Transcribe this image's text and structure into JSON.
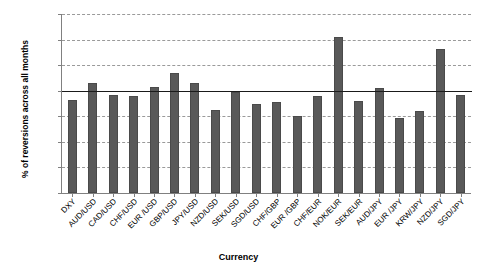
{
  "chart_data": {
    "type": "bar",
    "title": "",
    "xlabel": "Currency",
    "ylabel": "% of reversions across all months",
    "ylim": [
      0,
      7
    ],
    "ytick_labels": [
      "0.0%",
      "1.0%",
      "2.0%",
      "3.0%",
      "4.0%",
      "5.0%",
      "6.0%",
      "7.0%"
    ],
    "ytick_values": [
      0,
      1,
      2,
      3,
      4,
      5,
      6,
      7
    ],
    "grid": true,
    "legend": "none",
    "bar_color": "#595959",
    "reference_line": {
      "value": 4.0,
      "label": "",
      "color": "#1a1a1a"
    },
    "categories": [
      "DXY",
      "AUD/USD",
      "CAD/USD",
      "CHF/USD",
      "EUR /USD",
      "GBP/USD",
      "JPY/USD",
      "NZD/USD",
      "SEK/USD",
      "SGD/USD",
      "CHF/GBP",
      "EUR /GBP",
      "CHF/EUR",
      "NOK/EUR",
      "SEK/EUR",
      "AUD/JPY",
      "EUR /JPY",
      "KRW/JPY",
      "NZD/JPY",
      "SGD/JPY"
    ],
    "values": [
      3.65,
      4.3,
      3.85,
      3.8,
      4.15,
      4.7,
      4.3,
      3.25,
      3.95,
      3.5,
      3.55,
      3.0,
      3.8,
      6.1,
      3.6,
      4.1,
      2.95,
      3.2,
      5.65,
      3.85
    ]
  }
}
